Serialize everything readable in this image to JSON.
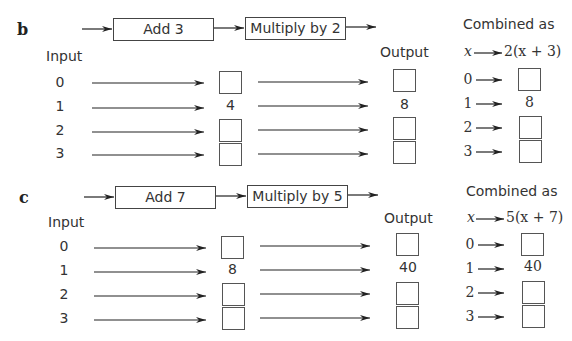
{
  "sections": [
    {
      "letter": "b",
      "step1": "Add 3",
      "step2": "Multiply by 2",
      "input_header": "Input",
      "output_header": "Output",
      "combined_header": "Combined as",
      "combined_var": "x",
      "combined_expr": "2(x + 3)",
      "inputs": [
        "0",
        "1",
        "2",
        "3"
      ],
      "middle": [
        "",
        "4",
        "",
        ""
      ],
      "outputs": [
        "",
        "8",
        "",
        ""
      ],
      "combined": [
        "",
        "8",
        "",
        ""
      ]
    },
    {
      "letter": "c",
      "step1": "Add 7",
      "step2": "Multiply by 5",
      "input_header": "Input",
      "output_header": "Output",
      "combined_header": "Combined as",
      "combined_var": "x",
      "combined_expr": "5(x + 7)",
      "inputs": [
        "0",
        "1",
        "2",
        "3"
      ],
      "middle": [
        "",
        "8",
        "",
        ""
      ],
      "outputs": [
        "",
        "40",
        "",
        ""
      ],
      "combined": [
        "",
        "40",
        "",
        ""
      ]
    }
  ]
}
